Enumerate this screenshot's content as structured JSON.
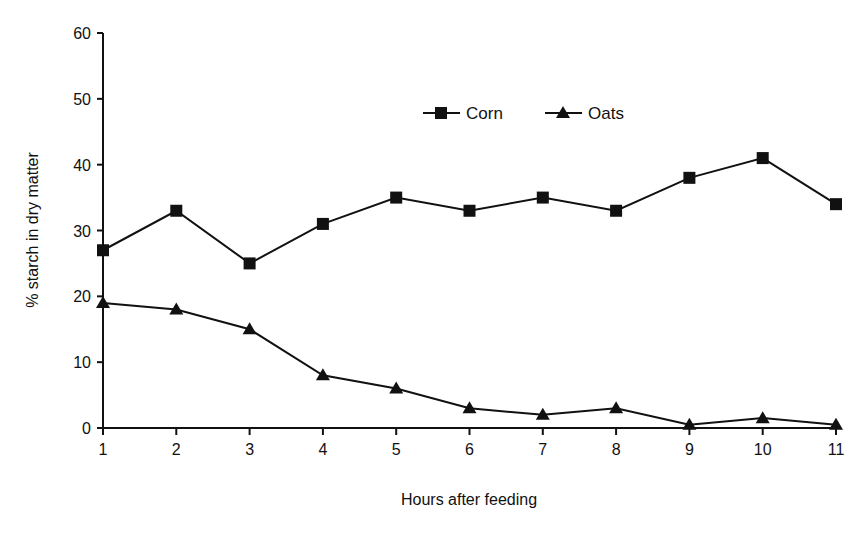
{
  "chart_data": {
    "type": "line",
    "title": "",
    "xlabel": "Hours after feeding",
    "ylabel": "% starch in dry matter",
    "x": [
      1,
      2,
      3,
      4,
      5,
      6,
      7,
      8,
      9,
      10,
      11
    ],
    "xticks": [
      "1",
      "2",
      "3",
      "4",
      "5",
      "6",
      "7",
      "8",
      "9",
      "10",
      "11"
    ],
    "yticks": [
      "0",
      "10",
      "20",
      "30",
      "40",
      "50",
      "60"
    ],
    "ylim": [
      0,
      60
    ],
    "xlim": [
      1,
      11
    ],
    "grid": false,
    "legend_position": "top-center",
    "series": [
      {
        "name": "Corn",
        "marker": "square",
        "color": "#111111",
        "values": [
          27,
          33,
          25,
          31,
          35,
          33,
          35,
          33,
          38,
          41,
          34
        ]
      },
      {
        "name": "Oats",
        "marker": "triangle",
        "color": "#111111",
        "values": [
          19,
          18,
          15,
          8,
          6,
          3,
          2,
          3,
          0.5,
          1.5,
          0.5
        ]
      }
    ]
  },
  "legend": {
    "items": [
      "Corn",
      "Oats"
    ]
  }
}
